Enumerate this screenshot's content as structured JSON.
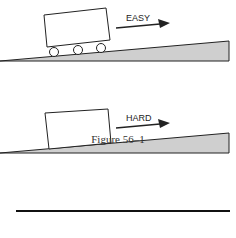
{
  "figure": {
    "top_panel": {
      "label": "EASY",
      "has_wheels": true
    },
    "bottom_panel": {
      "label": "HARD",
      "has_wheels": false
    },
    "caption": "Figure 56–1",
    "colors": {
      "ramp_fill": "#cfcfcf",
      "stroke": "#222222"
    }
  }
}
